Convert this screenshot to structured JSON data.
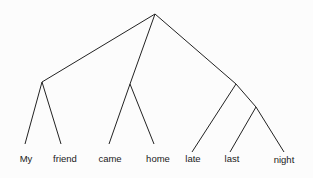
{
  "diagram": {
    "type": "syntax-tree",
    "leaves": [
      {
        "label": "My",
        "x": 26,
        "y": 158
      },
      {
        "label": "friend",
        "x": 64,
        "y": 158
      },
      {
        "label": "came",
        "x": 110,
        "y": 158
      },
      {
        "label": "home",
        "x": 158,
        "y": 158
      },
      {
        "label": "late",
        "x": 193,
        "y": 158
      },
      {
        "label": "last",
        "x": 232,
        "y": 158
      },
      {
        "label": "night",
        "x": 284,
        "y": 159
      }
    ],
    "nodes": {
      "root": {
        "x": 155,
        "y": 14
      },
      "np": {
        "x": 42,
        "y": 82
      },
      "vp": {
        "x": 130,
        "y": 84
      },
      "adv": {
        "x": 236,
        "y": 84
      },
      "adv_sub": {
        "x": 256,
        "y": 107
      }
    },
    "line_color": "#222222"
  }
}
